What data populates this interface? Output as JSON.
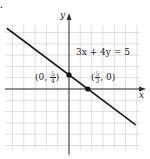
{
  "corner_label": ".",
  "chart_data": {
    "type": "line",
    "title": "",
    "equation": "3x + 4y = 5",
    "xlabel": "x",
    "ylabel": "y",
    "grid": true,
    "xlim": [
      -5.5,
      6.5
    ],
    "ylim": [
      -5.5,
      5.5
    ],
    "series": [
      {
        "name": "3x + 4y = 5",
        "x": [
          -5.5,
          5.9
        ],
        "y": [
          5.375,
          -3.175
        ]
      }
    ],
    "points": [
      {
        "label": "(0, 5/4)",
        "x": 0,
        "y": 1.25,
        "label_prefix": "(0, ",
        "num": "5",
        "den": "4",
        "label_suffix": ")"
      },
      {
        "label": "(5/3, 0)",
        "x": 1.6667,
        "y": 0,
        "label_prefix": "(",
        "num": "5",
        "den": "3",
        "label_suffix": ", 0)"
      }
    ],
    "colors": {
      "line": "#1a1a1a",
      "grid": "#d6d6d6",
      "axis": "#333333",
      "point": "#111111"
    }
  }
}
